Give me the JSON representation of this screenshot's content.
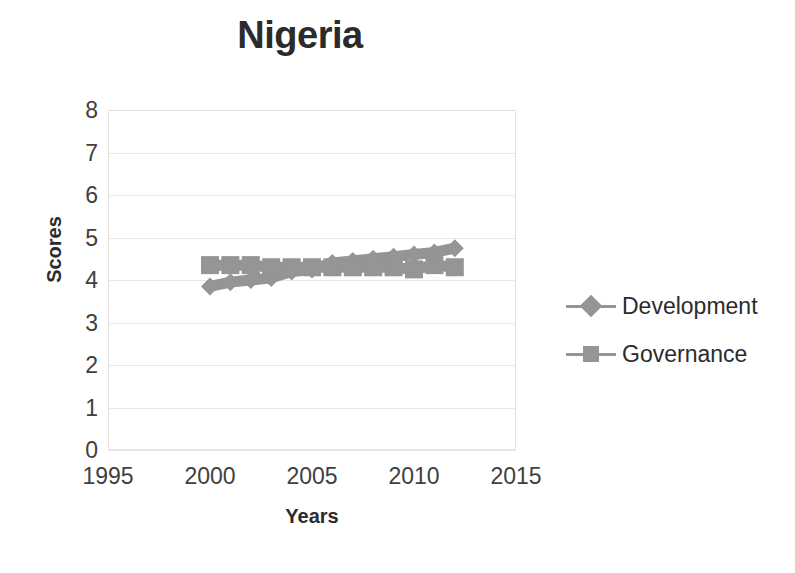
{
  "chart_data": {
    "type": "line",
    "title": "Nigeria",
    "xlabel": "Years",
    "ylabel": "Scores",
    "xlim": [
      1995,
      2015
    ],
    "ylim": [
      0,
      8
    ],
    "xticks": [
      1995,
      2000,
      2005,
      2010,
      2015
    ],
    "yticks": [
      0,
      1,
      2,
      3,
      4,
      5,
      6,
      7,
      8
    ],
    "grid": true,
    "legend_position": "right",
    "x": [
      2000,
      2001,
      2002,
      2003,
      2004,
      2005,
      2006,
      2007,
      2008,
      2009,
      2010,
      2011,
      2012
    ],
    "series": [
      {
        "name": "Development",
        "marker": "diamond",
        "color": "#959595",
        "values": [
          3.85,
          3.95,
          4.0,
          4.05,
          4.2,
          4.25,
          4.4,
          4.45,
          4.5,
          4.55,
          4.6,
          4.65,
          4.75
        ]
      },
      {
        "name": "Governance",
        "marker": "square",
        "color": "#959595",
        "values": [
          4.35,
          4.35,
          4.35,
          4.3,
          4.3,
          4.3,
          4.3,
          4.3,
          4.3,
          4.3,
          4.25,
          4.35,
          4.3
        ]
      }
    ]
  },
  "colors": {
    "series_gray": "#959595",
    "grid": "#e8e8e8",
    "frame": "#e2e2e2",
    "text": "#2b2b2b",
    "tick_text": "#404040",
    "background": "#ffffff"
  }
}
